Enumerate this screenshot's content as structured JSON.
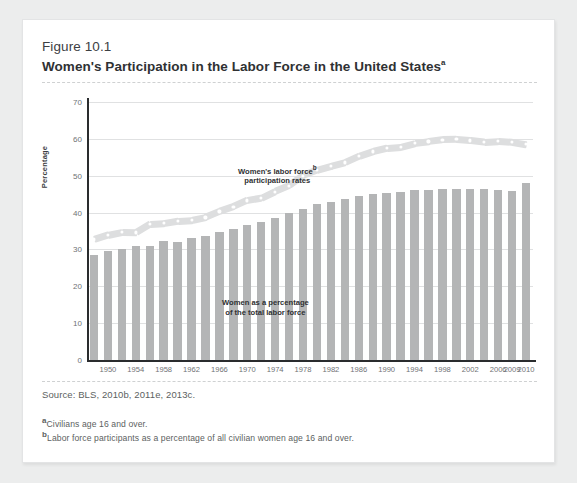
{
  "figure": {
    "number": "Figure 10.1",
    "title": "Women's Participation in the Labor Force in the United States",
    "title_superscript": "a",
    "source": "Source:  BLS, 2010b, 2011e, 2013c.",
    "footnotes": [
      {
        "marker": "a",
        "text": "Civilians age 16 and over."
      },
      {
        "marker": "b",
        "text": "Labor force participants as a percentage of all civilian women age 16 and over."
      }
    ]
  },
  "colors": {
    "page_background": "#eceded",
    "card_background": "#ffffff",
    "bar": "#b4b5b6",
    "line_band": "#dddedf",
    "dot": "#ffffff",
    "axis": "#2a2c2e",
    "grid": "#e0e1e2",
    "tick_text": "#6f7275",
    "title_text": "#2f3133"
  },
  "chart_data": {
    "type": "bar",
    "title": "Women's Participation in the Labor Force in the United States",
    "xlabel": "",
    "ylabel": "Percentage",
    "ylim": [
      0,
      70
    ],
    "yticks": [
      0,
      10,
      20,
      30,
      40,
      50,
      60,
      70
    ],
    "grid": true,
    "legend": "none",
    "annotations": [
      {
        "name": "line-series-label",
        "lines": [
          "Women's labor force",
          "participation rates"
        ],
        "superscript": "b"
      },
      {
        "name": "bar-series-label",
        "lines": [
          "Women as a percentage",
          "of the total labor force"
        ]
      }
    ],
    "x": [
      1948,
      1950,
      1952,
      1954,
      1956,
      1958,
      1960,
      1962,
      1964,
      1966,
      1968,
      1970,
      1972,
      1974,
      1976,
      1978,
      1980,
      1982,
      1984,
      1986,
      1988,
      1990,
      1992,
      1994,
      1996,
      1998,
      2000,
      2002,
      2004,
      2006,
      2009,
      2010
    ],
    "xtick_labels": [
      "",
      "1950",
      "",
      "1954",
      "",
      "1958",
      "",
      "1962",
      "",
      "1966",
      "",
      "1970",
      "",
      "1974",
      "",
      "1978",
      "",
      "1982",
      "",
      "1986",
      "",
      "1990",
      "",
      "1994",
      "",
      "1998",
      "",
      "2002",
      "",
      "2006",
      "2009",
      "2010"
    ],
    "series": [
      {
        "name": "Women as a percentage of the total labor force",
        "type": "bar",
        "values": [
          28.6,
          29.6,
          30.0,
          31.0,
          31.0,
          32.2,
          32.1,
          33.2,
          33.7,
          34.8,
          35.6,
          36.7,
          37.4,
          38.6,
          39.8,
          41.1,
          42.4,
          43.0,
          43.7,
          44.5,
          45.0,
          45.2,
          45.5,
          46.0,
          46.2,
          46.3,
          46.5,
          46.5,
          46.4,
          46.0,
          45.9,
          47.9
        ]
      },
      {
        "name": "Women's labor force participation rates",
        "type": "line",
        "values": [
          32.7,
          33.9,
          34.7,
          34.6,
          36.9,
          37.1,
          37.7,
          37.9,
          38.7,
          40.3,
          41.6,
          43.3,
          43.9,
          45.7,
          47.3,
          50.0,
          51.5,
          52.6,
          53.6,
          55.3,
          56.6,
          57.5,
          57.8,
          58.8,
          59.3,
          59.8,
          59.9,
          59.6,
          59.2,
          59.4,
          59.2,
          58.6
        ]
      }
    ]
  }
}
